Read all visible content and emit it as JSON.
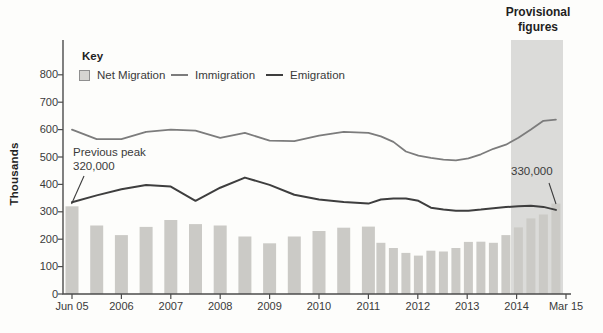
{
  "title_note": {
    "lines": [
      "Provisional",
      "figures"
    ]
  },
  "legend": {
    "title": "Key",
    "items": [
      {
        "label": "Net Migration",
        "swatch": "bar-square"
      },
      {
        "label": "Immigration",
        "swatch": "gray-line"
      },
      {
        "label": "Emigration",
        "swatch": "dark-line"
      }
    ]
  },
  "annotations": {
    "previous_peak_line1": "Previous peak",
    "previous_peak_line2": "320,000",
    "final_value": "330,000"
  },
  "y_axis": {
    "label": "Thousands",
    "ticks": [
      "0",
      "100",
      "200",
      "300",
      "400",
      "500",
      "600",
      "700",
      "800"
    ]
  },
  "x_axis": {
    "ticks": [
      "Jun 05",
      "2006",
      "2007",
      "2008",
      "2009",
      "2010",
      "2011",
      "2012",
      "2013",
      "2014",
      "Mar 15"
    ]
  },
  "colors": {
    "bar": "#cbcac6",
    "immigration": "#7c7c7c",
    "emigration": "#3e3e3e",
    "band": "#dbdbd9",
    "axis": "#4c4c4c",
    "text": "#3a3a3a"
  },
  "chart_data": {
    "type": "bar",
    "subtype": "combo bar+line, thousands of people, rolling-year values",
    "title": "",
    "xlabel": "",
    "ylabel": "Thousands",
    "ylim": [
      0,
      800
    ],
    "grid": false,
    "legend_position": "top-left inside plot",
    "provisional_band_label": "Provisional figures",
    "provisional_band_range": [
      "YE Jun 14",
      "YE Mar 15"
    ],
    "annotations": [
      "Previous peak 320,000 (first bar)",
      "330,000 (last value, provisional)"
    ],
    "categories": [
      "YE Jun 05",
      "YE Dec 05",
      "YE Jun 06",
      "YE Dec 06",
      "YE Jun 07",
      "YE Dec 07",
      "YE Jun 08",
      "YE Dec 08",
      "YE Jun 09",
      "YE Dec 09",
      "YE Jun 10",
      "YE Dec 10",
      "YE Jun 11",
      "YE Sep 11",
      "YE Dec 11",
      "YE Mar 12",
      "YE Jun 12",
      "YE Sep 12",
      "YE Dec 12",
      "YE Mar 13",
      "YE Jun 13",
      "YE Sep 13",
      "YE Dec 13",
      "YE Mar 14",
      "YE Jun 14",
      "YE Sep 14",
      "YE Dec 14",
      "YE Mar 15"
    ],
    "series": [
      {
        "name": "Net Migration",
        "type": "bar",
        "values": [
          320,
          250,
          215,
          245,
          270,
          255,
          250,
          210,
          185,
          210,
          230,
          242,
          246,
          187,
          168,
          150,
          140,
          158,
          155,
          168,
          190,
          191,
          187,
          215,
          243,
          276,
          290,
          330
        ]
      },
      {
        "name": "Immigration",
        "type": "line",
        "values": [
          600,
          565,
          565,
          592,
          600,
          596,
          570,
          588,
          560,
          558,
          578,
          592,
          588,
          575,
          555,
          520,
          505,
          497,
          490,
          488,
          495,
          510,
          530,
          545,
          570,
          600,
          632,
          636
        ]
      },
      {
        "name": "Emigration",
        "type": "line",
        "values": [
          335,
          360,
          382,
          398,
          392,
          340,
          388,
          425,
          398,
          362,
          345,
          336,
          330,
          345,
          349,
          349,
          340,
          315,
          308,
          304,
          304,
          308,
          313,
          317,
          320,
          322,
          318,
          307
        ]
      }
    ]
  }
}
